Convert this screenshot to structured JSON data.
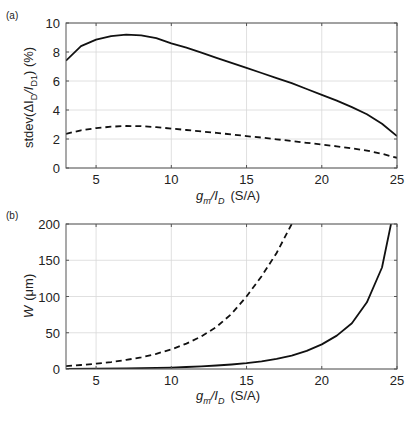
{
  "chart_data": [
    {
      "panel": "(a)",
      "type": "line",
      "title": "",
      "xlabel": "g_m/I_D (S/A)",
      "ylabel": "stdev(ΔI_D/I_D1) (%)",
      "xlim": [
        3,
        25
      ],
      "ylim": [
        0,
        10
      ],
      "xticks": [
        5,
        10,
        15,
        20,
        25
      ],
      "yticks": [
        0,
        2,
        4,
        6,
        8,
        10
      ],
      "grid": true,
      "legend": null,
      "x": [
        3,
        4,
        5,
        6,
        7,
        8,
        9,
        10,
        11,
        12,
        13,
        14,
        15,
        16,
        17,
        18,
        19,
        20,
        21,
        22,
        23,
        24,
        25
      ],
      "series": [
        {
          "name": "solid",
          "style": "solid",
          "values": [
            7.4,
            8.4,
            8.85,
            9.1,
            9.2,
            9.15,
            8.95,
            8.6,
            8.3,
            7.95,
            7.6,
            7.25,
            6.9,
            6.55,
            6.2,
            5.85,
            5.45,
            5.05,
            4.65,
            4.2,
            3.7,
            3.05,
            2.2
          ]
        },
        {
          "name": "dashed",
          "style": "dashed",
          "values": [
            2.35,
            2.6,
            2.75,
            2.85,
            2.9,
            2.88,
            2.82,
            2.72,
            2.62,
            2.52,
            2.42,
            2.32,
            2.2,
            2.1,
            1.98,
            1.86,
            1.74,
            1.62,
            1.5,
            1.35,
            1.2,
            0.98,
            0.7
          ]
        }
      ]
    },
    {
      "panel": "(b)",
      "type": "line",
      "title": "",
      "xlabel": "g_m/I_D (S/A)",
      "ylabel": "W (μm)",
      "xlim": [
        3,
        25
      ],
      "ylim": [
        0,
        200
      ],
      "xticks": [
        5,
        10,
        15,
        20,
        25
      ],
      "yticks": [
        0,
        50,
        100,
        150,
        200
      ],
      "grid": true,
      "legend": null,
      "series": [
        {
          "name": "solid",
          "style": "solid",
          "x": [
            3,
            5,
            7,
            9,
            10,
            11,
            12,
            13,
            14,
            15,
            16,
            17,
            18,
            19,
            20,
            21,
            22,
            23,
            24,
            24.6
          ],
          "values": [
            0.3,
            0.5,
            0.9,
            1.5,
            2,
            2.7,
            3.6,
            4.8,
            6.2,
            8,
            10.5,
            14,
            18.5,
            25,
            34,
            46,
            63,
            92,
            140,
            200
          ]
        },
        {
          "name": "dashed",
          "style": "dashed",
          "x": [
            3,
            4,
            5,
            6,
            7,
            8,
            9,
            10,
            11,
            12,
            13,
            14,
            15,
            16,
            17,
            18
          ],
          "values": [
            4,
            5.5,
            7.3,
            9.5,
            12.5,
            16,
            21,
            27,
            35,
            45,
            58,
            76,
            100,
            128,
            160,
            200
          ]
        }
      ]
    }
  ],
  "labels": {
    "panel_a": "(a)",
    "panel_b": "(b)",
    "xlabel_main": "g",
    "xlabel_sub_m": "m",
    "xlabel_slash": "/I",
    "xlabel_sub_d": "D",
    "xlabel_unit": "(S/A)",
    "ylabel_a_prefix": "stdev(ΔI",
    "ylabel_a_sub_d": "D",
    "ylabel_a_slash": "/I",
    "ylabel_a_sub_d1": "D1",
    "ylabel_a_suffix": ")  (%)",
    "ylabel_b_main": "W",
    "ylabel_b_unit": "(μm)"
  },
  "colors": {
    "line": "#111111",
    "grid": "#d8d8d8",
    "axis": "#555555"
  }
}
